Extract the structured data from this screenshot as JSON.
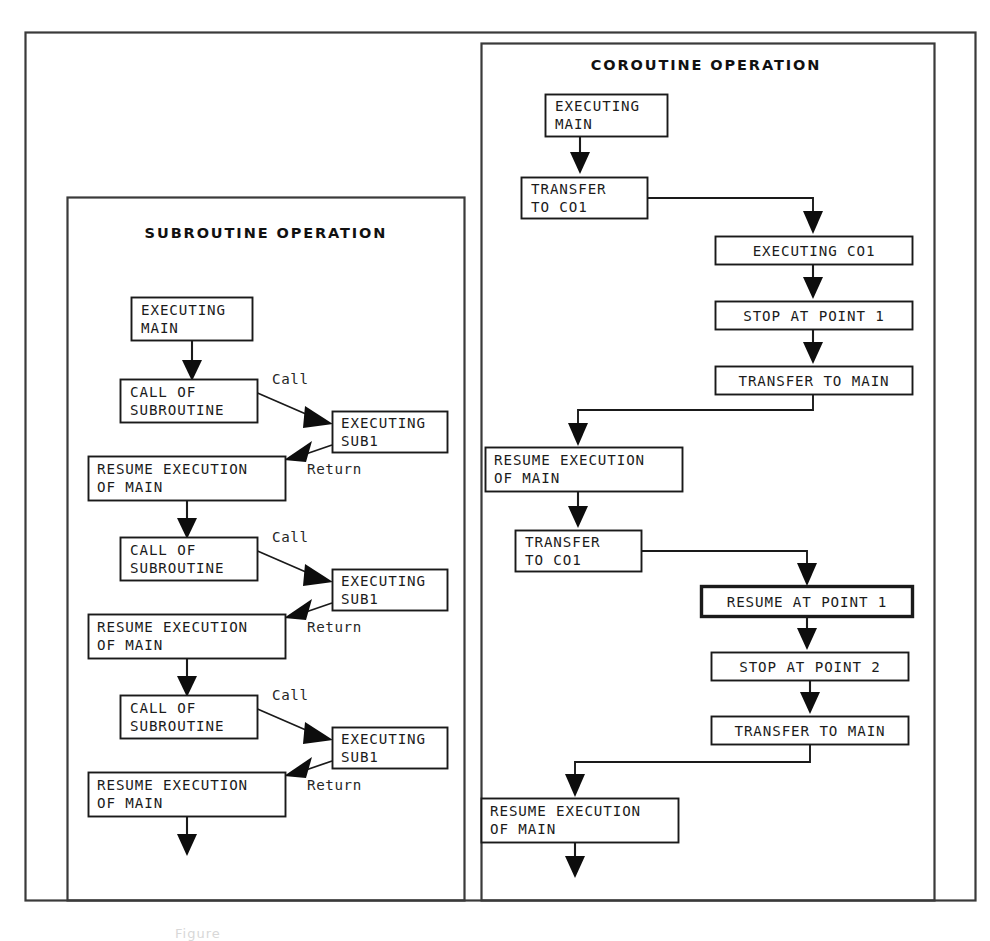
{
  "figure": {
    "kind": "flowchart",
    "caption": "Figure",
    "outer_frame": "document-border",
    "panels": [
      {
        "id": "subroutine",
        "title": "SUBROUTINE OPERATION",
        "nodes": [
          {
            "id": "sub-n1",
            "lines": [
              "EXECUTING",
              "MAIN"
            ],
            "align": "left",
            "emphasis": false
          },
          {
            "id": "sub-n2",
            "lines": [
              "CALL OF",
              "SUBROUTINE"
            ],
            "align": "left",
            "emphasis": false
          },
          {
            "id": "sub-n3",
            "lines": [
              "EXECUTING",
              "SUB1"
            ],
            "align": "left",
            "emphasis": false
          },
          {
            "id": "sub-n4",
            "lines": [
              "RESUME EXECUTION",
              "OF MAIN"
            ],
            "align": "left",
            "emphasis": false
          },
          {
            "id": "sub-n5",
            "lines": [
              "CALL OF",
              "SUBROUTINE"
            ],
            "align": "left",
            "emphasis": false
          },
          {
            "id": "sub-n6",
            "lines": [
              "EXECUTING",
              "SUB1"
            ],
            "align": "left",
            "emphasis": false
          },
          {
            "id": "sub-n7",
            "lines": [
              "RESUME EXECUTION",
              "OF MAIN"
            ],
            "align": "left",
            "emphasis": false
          },
          {
            "id": "sub-n8",
            "lines": [
              "CALL OF",
              "SUBROUTINE"
            ],
            "align": "left",
            "emphasis": false
          },
          {
            "id": "sub-n9",
            "lines": [
              "EXECUTING",
              "SUB1"
            ],
            "align": "left",
            "emphasis": false
          },
          {
            "id": "sub-n10",
            "lines": [
              "RESUME EXECUTION",
              "OF MAIN"
            ],
            "align": "left",
            "emphasis": false
          }
        ],
        "edge_labels": [
          {
            "id": "sub-call-1",
            "text": "Call"
          },
          {
            "id": "sub-return-1",
            "text": "Return"
          },
          {
            "id": "sub-call-2",
            "text": "Call"
          },
          {
            "id": "sub-return-2",
            "text": "Return"
          },
          {
            "id": "sub-call-3",
            "text": "Call"
          },
          {
            "id": "sub-return-3",
            "text": "Return"
          }
        ]
      },
      {
        "id": "coroutine",
        "title": "COROUTINE OPERATION",
        "nodes": [
          {
            "id": "co-n1",
            "lines": [
              "EXECUTING",
              "MAIN"
            ],
            "align": "left",
            "emphasis": false
          },
          {
            "id": "co-n2",
            "lines": [
              "TRANSFER",
              "TO CO1"
            ],
            "align": "left",
            "emphasis": false
          },
          {
            "id": "co-n3",
            "lines": [
              "EXECUTING CO1"
            ],
            "align": "center",
            "emphasis": false
          },
          {
            "id": "co-n4",
            "lines": [
              "STOP AT POINT 1"
            ],
            "align": "center",
            "emphasis": false
          },
          {
            "id": "co-n5",
            "lines": [
              "TRANSFER TO MAIN"
            ],
            "align": "center",
            "emphasis": false
          },
          {
            "id": "co-n6",
            "lines": [
              "RESUME EXECUTION",
              "OF MAIN"
            ],
            "align": "left",
            "emphasis": false
          },
          {
            "id": "co-n7",
            "lines": [
              "TRANSFER",
              "TO CO1"
            ],
            "align": "left",
            "emphasis": false
          },
          {
            "id": "co-n8",
            "lines": [
              "RESUME AT POINT 1"
            ],
            "align": "center",
            "emphasis": true
          },
          {
            "id": "co-n9",
            "lines": [
              "STOP AT POINT 2"
            ],
            "align": "center",
            "emphasis": false
          },
          {
            "id": "co-n10",
            "lines": [
              "TRANSFER TO MAIN"
            ],
            "align": "center",
            "emphasis": false
          },
          {
            "id": "co-n11",
            "lines": [
              "RESUME EXECUTION",
              "OF MAIN"
            ],
            "align": "left",
            "emphasis": false
          }
        ],
        "edge_labels": []
      }
    ],
    "colors": {
      "ink": "#1a1a1a",
      "frame": "#3a3a3a",
      "paper": "#ffffff",
      "arrow_fill": "#0d0d0d"
    }
  }
}
